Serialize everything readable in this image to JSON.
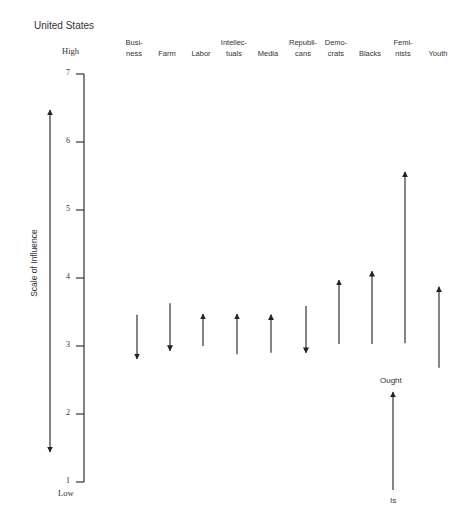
{
  "chart_data": {
    "type": "arrow",
    "title": "United States",
    "ylabel": "Scale of Influence",
    "ylim": [
      1,
      7
    ],
    "yticks": [
      1,
      2,
      3,
      4,
      5,
      6,
      7
    ],
    "y_high_label": "High",
    "y_low_label": "Low",
    "grid": false,
    "categories": [
      "Business",
      "Farm",
      "Labor",
      "Intellectuals",
      "Media",
      "Republicans",
      "Democrats",
      "Blacks",
      "Feminists",
      "Youth"
    ],
    "category_labels": [
      [
        "Busi-",
        "ness"
      ],
      [
        "",
        "Farm"
      ],
      [
        "",
        "Labor"
      ],
      [
        "Intellec-",
        "tuals"
      ],
      [
        "",
        "Media"
      ],
      [
        "Republi-",
        "cans"
      ],
      [
        "Demo-",
        "crats"
      ],
      [
        "",
        "Blacks"
      ],
      [
        "Femi-",
        "nists"
      ],
      [
        "",
        "Youth"
      ]
    ],
    "series": [
      {
        "name": "Is",
        "values": [
          3.46,
          3.63,
          3.0,
          2.88,
          2.9,
          3.59,
          3.03,
          3.03,
          3.04,
          2.68
        ]
      },
      {
        "name": "Ought",
        "values": [
          2.81,
          2.93,
          3.47,
          3.47,
          3.46,
          2.9,
          3.97,
          4.1,
          5.56,
          3.87
        ]
      }
    ],
    "legend": {
      "from_label": "Is",
      "to_label": "Ought",
      "position": "bottom-right"
    }
  },
  "layout": {
    "arrow_x": [
      137,
      170,
      203,
      237,
      271,
      306,
      339,
      372,
      405,
      439
    ],
    "label_x": [
      130,
      163,
      197,
      230,
      264,
      299,
      332,
      366,
      399,
      434
    ]
  }
}
